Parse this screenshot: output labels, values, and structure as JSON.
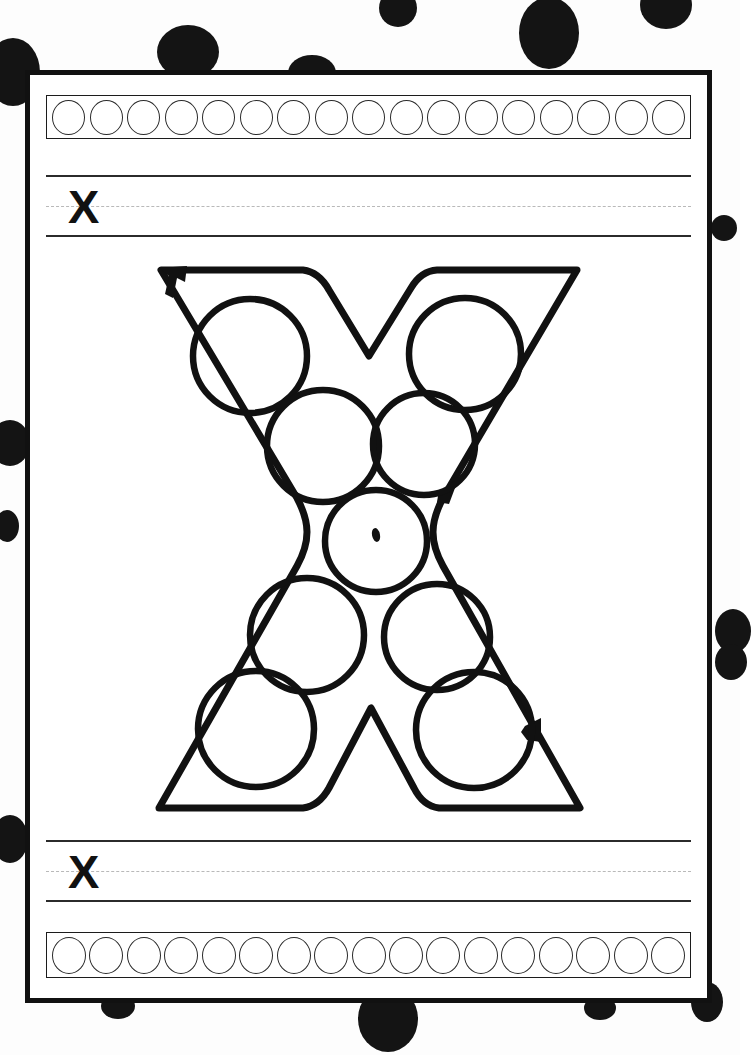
{
  "worksheet": {
    "kind": "letter-tracing-dot-marker-worksheet",
    "letter": "X",
    "letter_case": "uppercase",
    "page_background_color": "#fdfdfd",
    "ink_color": "#111111",
    "sheet_border_color": "#111111",
    "guideline_solid_color": "#2b2b2b",
    "guideline_dashed_color": "#b9b9b9"
  },
  "top_strip": {
    "name": "dot-practice-strip-top",
    "circle_count": 17,
    "circle_fill": "none",
    "circle_stroke": "#2a2a2a"
  },
  "bottom_strip": {
    "name": "dot-practice-strip-bottom",
    "circle_count": 17,
    "circle_fill": "none",
    "circle_stroke": "#2a2a2a"
  },
  "handwriting_top": {
    "name": "handwriting-line-top",
    "letter": "X",
    "has_dashed_midline": true
  },
  "handwriting_bottom": {
    "name": "handwriting-line-bottom",
    "letter": "X",
    "has_dashed_midline": true
  },
  "letter_art": {
    "name": "big-letter-X-outline",
    "letter": "X",
    "dot_circle_count": 9,
    "stroke_direction_markers": 3,
    "dot_positions": [
      {
        "id": "upper-left-arm",
        "cx": 107,
        "cy": 96,
        "r": 57
      },
      {
        "id": "upper-right-arm",
        "cx": 322,
        "cy": 94,
        "r": 56
      },
      {
        "id": "mid-upper-left",
        "cx": 180,
        "cy": 186,
        "r": 56
      },
      {
        "id": "mid-upper-right",
        "cx": 281,
        "cy": 184,
        "r": 51
      },
      {
        "id": "center",
        "cx": 233,
        "cy": 281,
        "r": 51
      },
      {
        "id": "mid-lower-left",
        "cx": 164,
        "cy": 375,
        "r": 57
      },
      {
        "id": "mid-lower-right",
        "cx": 294,
        "cy": 377,
        "r": 53
      },
      {
        "id": "bottom-left-leg",
        "cx": 113,
        "cy": 469,
        "r": 58
      },
      {
        "id": "bottom-right-leg",
        "cx": 331,
        "cy": 470,
        "r": 58
      }
    ]
  },
  "background_dots": [
    {
      "cx": 13,
      "cy": 72,
      "rx": 27,
      "ry": 34
    },
    {
      "cx": 188,
      "cy": 52,
      "rx": 31,
      "ry": 27
    },
    {
      "cx": 312,
      "cy": 73,
      "rx": 24,
      "ry": 18
    },
    {
      "cx": 398,
      "cy": 8,
      "rx": 19,
      "ry": 19
    },
    {
      "cx": 549,
      "cy": 33,
      "rx": 30,
      "ry": 36
    },
    {
      "cx": 666,
      "cy": 5,
      "rx": 26,
      "ry": 24
    },
    {
      "cx": 724,
      "cy": 228,
      "rx": 13,
      "ry": 13
    },
    {
      "cx": 10,
      "cy": 443,
      "rx": 20,
      "ry": 23
    },
    {
      "cx": 7,
      "cy": 526,
      "rx": 12,
      "ry": 16
    },
    {
      "cx": 733,
      "cy": 631,
      "rx": 18,
      "ry": 22
    },
    {
      "cx": 731,
      "cy": 662,
      "rx": 16,
      "ry": 18
    },
    {
      "cx": 10,
      "cy": 839,
      "rx": 18,
      "ry": 24
    },
    {
      "cx": 707,
      "cy": 1002,
      "rx": 16,
      "ry": 20
    },
    {
      "cx": 600,
      "cy": 1008,
      "rx": 16,
      "ry": 12
    },
    {
      "cx": 388,
      "cy": 1019,
      "rx": 30,
      "ry": 33
    },
    {
      "cx": 118,
      "cy": 1006,
      "rx": 17,
      "ry": 13
    }
  ]
}
